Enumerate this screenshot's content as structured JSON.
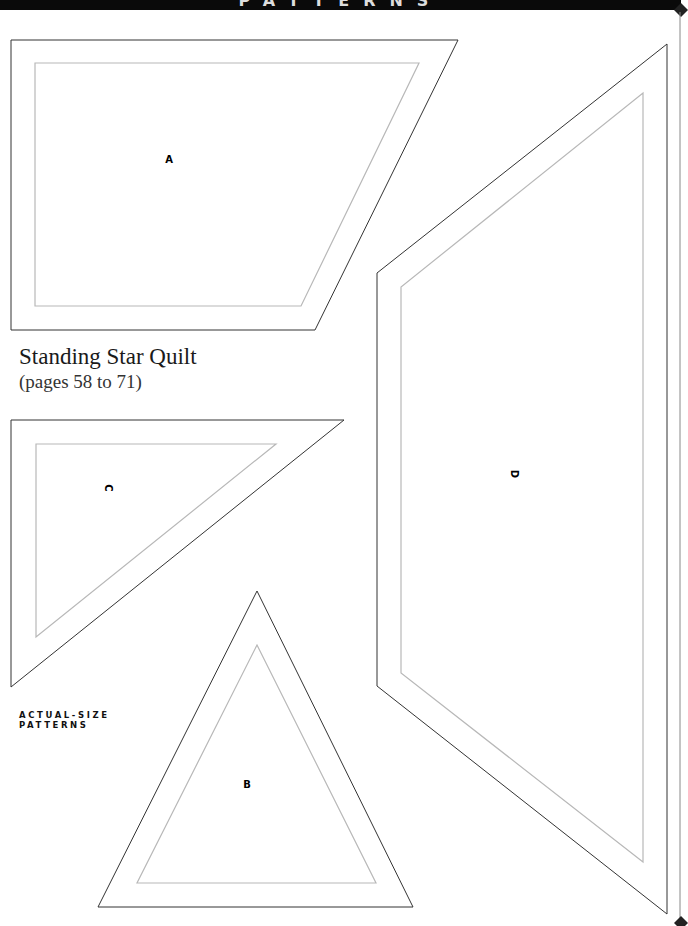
{
  "header": {
    "banner_text": "PATTERNS"
  },
  "section": {
    "title": "Standing Star Quilt",
    "subtitle": "(pages 58 to 71)",
    "caption_line1": "ACTUAL-SIZE",
    "caption_line2": "PATTERNS"
  },
  "colors": {
    "cut_line": "#333333",
    "sew_line": "#b8b8b8",
    "banner": "#0a0a0a"
  },
  "pieces": [
    {
      "id": "A",
      "label": "A",
      "outer": "11,40 458,40 315,330 11,330",
      "inner": "35,63 419,63 301,306 35,306"
    },
    {
      "id": "B",
      "label": "B",
      "outer": "257,591 413,907 98,907",
      "inner": "257,645 376,883 137,883"
    },
    {
      "id": "C",
      "label": "C",
      "outer": "11,420 344,420 11,687",
      "inner": "36,444 276,444 36,637"
    },
    {
      "id": "D",
      "label": "D",
      "outer": "667,44 667,914 377,686 377,273",
      "inner": "643,93 643,862 401,673 401,287"
    }
  ]
}
